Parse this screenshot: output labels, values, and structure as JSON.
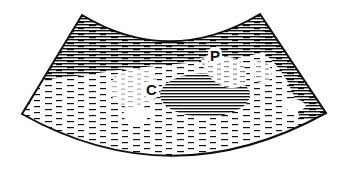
{
  "diagram": {
    "type": "ultrasound-sector-scan-illustration",
    "labels": [
      {
        "id": "P",
        "text": "P"
      },
      {
        "id": "C",
        "text": "C"
      }
    ],
    "colors": {
      "ink": "#111111",
      "background": "#ffffff"
    }
  }
}
